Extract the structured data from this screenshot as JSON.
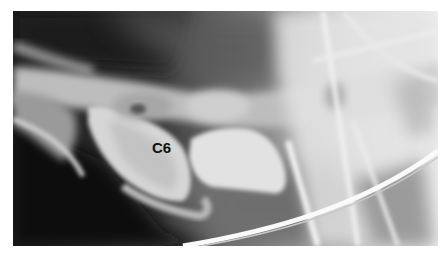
{
  "image": {
    "type": "radiograph",
    "view": "lateral cervical spine",
    "annotations": [
      {
        "text": "C6",
        "target": "sixth-cervical-vertebra"
      }
    ],
    "palette": {
      "background": "#1a1a1a",
      "soft_tissue": "#7a7a7a",
      "bone": "#e6e6e6",
      "label_text": "#111111",
      "page_border": "#ffffff"
    }
  }
}
